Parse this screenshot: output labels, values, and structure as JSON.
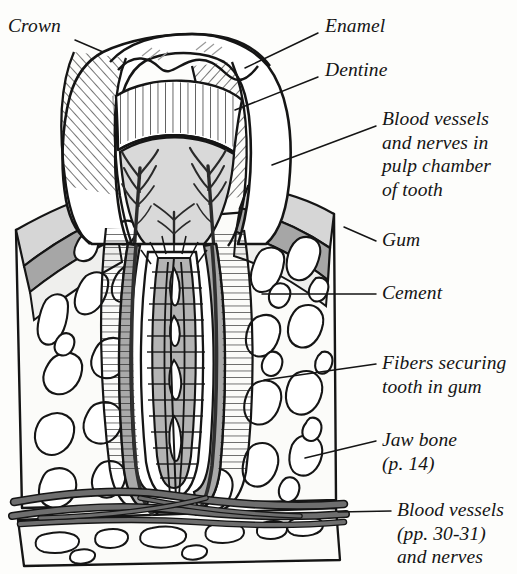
{
  "figure": {
    "kind": "anatomical-line-diagram",
    "style": "black ink line art with gray wash shading and hatching",
    "background_color": "#fdfdfb",
    "ink_color": "#151515"
  },
  "palette": {
    "ink": "#151515",
    "paper": "#fdfdfb",
    "enamel_fill": "#ffffff",
    "dentine_fill": "#ffffff",
    "pulp_fill": "#d9d9d9",
    "gum_light": "#d6d6d6",
    "gum_dark": "#a6a6a6",
    "cement_fill": "#a9a9a9",
    "bone_fill": "#fbfbf9",
    "vessel_fill": "#6e6e6e"
  },
  "labels": [
    {
      "id": "crown",
      "lines": [
        "Crown"
      ],
      "x": 8,
      "y": 14,
      "align": "left",
      "leader": [
        [
          75,
          40
        ],
        [
          103,
          52
        ]
      ]
    },
    {
      "id": "enamel",
      "lines": [
        "Enamel"
      ],
      "x": 325,
      "y": 14,
      "align": "left",
      "leader": [
        [
          318,
          33
        ],
        [
          245,
          68
        ]
      ]
    },
    {
      "id": "dentine",
      "lines": [
        "Dentine"
      ],
      "x": 325,
      "y": 58,
      "align": "left",
      "leader": [
        [
          318,
          77
        ],
        [
          235,
          110
        ]
      ]
    },
    {
      "id": "pulp-chamber",
      "lines": [
        "Blood vessels",
        "and nerves in",
        "pulp chamber",
        "of tooth"
      ],
      "x": 382,
      "y": 107,
      "align": "left",
      "leader": [
        [
          376,
          126
        ],
        [
          272,
          165
        ]
      ]
    },
    {
      "id": "gum",
      "lines": [
        "Gum"
      ],
      "x": 382,
      "y": 228,
      "align": "left",
      "leader": [
        [
          376,
          241
        ],
        [
          344,
          227
        ]
      ]
    },
    {
      "id": "cement",
      "lines": [
        "Cement"
      ],
      "x": 382,
      "y": 281,
      "align": "left",
      "leader": [
        [
          376,
          294
        ],
        [
          262,
          294
        ]
      ]
    },
    {
      "id": "fibers",
      "lines": [
        "Fibers securing",
        "tooth in gum"
      ],
      "x": 382,
      "y": 351,
      "align": "left",
      "leader": [
        [
          376,
          364
        ],
        [
          264,
          380
        ]
      ]
    },
    {
      "id": "jaw-bone",
      "lines": [
        "Jaw bone",
        "(p. 14)"
      ],
      "x": 382,
      "y": 428,
      "align": "left",
      "leader": [
        [
          376,
          441
        ],
        [
          305,
          458
        ]
      ]
    },
    {
      "id": "blood-vessels-bottom",
      "lines": [
        "Blood vessels",
        "(pp. 30-31)",
        "and nerves"
      ],
      "x": 397,
      "y": 498,
      "align": "left",
      "leader": [
        [
          391,
          511
        ],
        [
          338,
          512
        ]
      ]
    }
  ],
  "structures": [
    {
      "id": "crown",
      "name": "Crown"
    },
    {
      "id": "enamel",
      "name": "Enamel"
    },
    {
      "id": "dentine",
      "name": "Dentine"
    },
    {
      "id": "pulp",
      "name": "Pulp chamber with blood vessels and nerves"
    },
    {
      "id": "gum",
      "name": "Gum"
    },
    {
      "id": "cement",
      "name": "Cement"
    },
    {
      "id": "fibers",
      "name": "Fibers securing tooth in gum"
    },
    {
      "id": "jaw-bone",
      "name": "Jaw bone"
    },
    {
      "id": "vessels",
      "name": "Blood vessels and nerves"
    }
  ]
}
